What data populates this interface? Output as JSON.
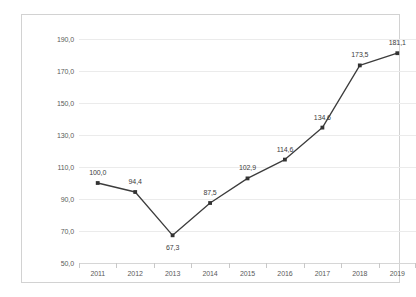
{
  "chart_data": {
    "type": "line",
    "title": "",
    "subtitle": "",
    "xlabel": "",
    "ylabel": "",
    "categories": [
      "2011",
      "2012",
      "2013",
      "2014",
      "2015",
      "2016",
      "2017",
      "2018",
      "2019"
    ],
    "values": [
      100.0,
      94.4,
      67.3,
      87.5,
      102.9,
      114.6,
      134.6,
      173.5,
      181.1
    ],
    "point_labels": [
      "100,0",
      "94,4",
      "67,3",
      "87,5",
      "102,9",
      "114,6",
      "134,6",
      "173,5",
      "181,1"
    ],
    "label_positions": [
      "above",
      "above",
      "below",
      "above",
      "above",
      "above",
      "above",
      "above",
      "above"
    ],
    "ylim": [
      50.0,
      190.0
    ],
    "ytick_values": [
      190.0,
      170.0,
      150.0,
      130.0,
      110.0,
      90.0,
      70.0,
      50.0
    ],
    "ytick_labels": [
      "190,0",
      "170,0",
      "150,0",
      "130,0",
      "110,0",
      "90,0",
      "70,0",
      "50,0"
    ],
    "grid": true,
    "legend": false,
    "legend_position": "none",
    "marker": "square",
    "series": [
      {
        "name": "",
        "values": [
          100.0,
          94.4,
          67.3,
          87.5,
          102.9,
          114.6,
          134.6,
          173.5,
          181.1
        ]
      }
    ]
  },
  "style": {
    "line_color": "#3c3c3c",
    "marker_color": "#333333",
    "grid_color": "#ebebeb",
    "axis_color": "#d6d6d6",
    "frame_color": "#d2d2d2",
    "tick_label_color": "#5a5a5a",
    "data_label_color": "#3c3c3c",
    "background_color": "#ffffff"
  }
}
